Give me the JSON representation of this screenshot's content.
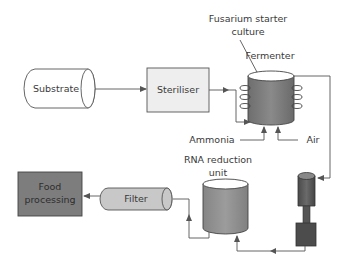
{
  "diagram": {
    "title": "",
    "nodes": {
      "substrate": {
        "label": "Substrate",
        "shape": "horizontal-cylinder",
        "fill": "#ffffff"
      },
      "steriliser": {
        "label": "Steriliser",
        "shape": "box",
        "fill": "#eeeeee"
      },
      "fermenter": {
        "label": "Fermenter",
        "shape": "vertical-cylinder-with-coils",
        "fill": "#7a7a7a"
      },
      "starter_culture": {
        "label_line1": "Fusarium starter",
        "label_line2": "culture"
      },
      "ammonia": {
        "label": "Ammonia"
      },
      "air": {
        "label": "Air"
      },
      "rna_reduction": {
        "label_line1": "RNA reduction",
        "label_line2": "unit",
        "shape": "vertical-cylinder",
        "fill": "#8a8a8a"
      },
      "centrifuge": {
        "label": "",
        "shape": "separator-column",
        "fill": "#555555"
      },
      "filter": {
        "label": "Filter",
        "shape": "horizontal-cylinder",
        "fill": "#c8c8c8"
      },
      "food_processing": {
        "label_line1": "Food",
        "label_line2": "processing",
        "shape": "box",
        "fill": "#7d7d7d"
      }
    },
    "edges": [
      {
        "from": "Substrate",
        "to": "Steriliser"
      },
      {
        "from": "Steriliser",
        "to": "Fermenter"
      },
      {
        "from": "Ammonia",
        "to": "Fermenter"
      },
      {
        "from": "Air",
        "to": "Fermenter"
      },
      {
        "from": "Fusarium starter culture",
        "to": "Fermenter"
      },
      {
        "from": "Fermenter",
        "to": "Centrifuge"
      },
      {
        "from": "Centrifuge",
        "to": "RNA reduction unit"
      },
      {
        "from": "RNA reduction unit",
        "to": "Filter"
      },
      {
        "from": "Filter",
        "to": "Food processing"
      }
    ],
    "colors": {
      "line": "#555555",
      "text": "#3a3a3a"
    }
  }
}
